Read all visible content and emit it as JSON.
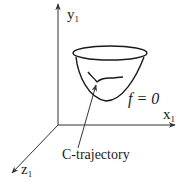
{
  "diagram": {
    "type": "3d-coordinate-sketch",
    "axes": {
      "x": {
        "label": "x",
        "subscript": "1"
      },
      "y": {
        "label": "y",
        "subscript": "1"
      },
      "z": {
        "label": "z",
        "subscript": "1"
      }
    },
    "surface": {
      "label": "f = 0",
      "shape": "paraboloid bowl"
    },
    "trajectory": {
      "label": "C-trajectory"
    },
    "colors": {
      "ink": "#1a1a1a",
      "background": "#ffffff"
    }
  }
}
